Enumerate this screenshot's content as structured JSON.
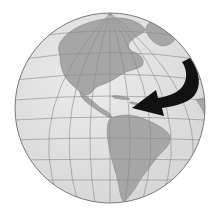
{
  "figure": {
    "type": "globe-illustration",
    "description": "Orthographic globe centered on the Americas with a curved black arrow sweeping from the North Atlantic toward the Caribbean",
    "view_center": "Americas / Western Hemisphere",
    "regions_shown": [
      "North America",
      "Central America",
      "Caribbean",
      "South America",
      "Greenland",
      "West Africa edge",
      "Atlantic Ocean",
      "Pacific Ocean"
    ],
    "annotation": {
      "type": "arrow",
      "direction": "from northeast Atlantic curving southwest to Caribbean",
      "color": "#111111"
    },
    "colors": {
      "ocean": "#e3e3e3",
      "land": "#a8a8a8",
      "grid": "#8a8a8a",
      "outline": "#7a7a7a",
      "arrow": "#111111",
      "background": "#ffffff"
    }
  }
}
